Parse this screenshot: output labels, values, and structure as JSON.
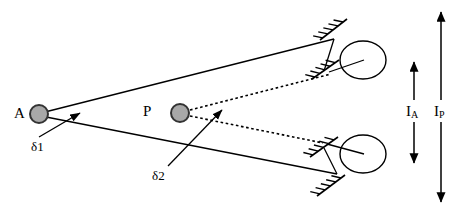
{
  "figure": {
    "background_color": "#ffffff",
    "line_color": "#000000",
    "node_fill_color": "#a8a8a8",
    "node_stroke_color": "#333333"
  },
  "nodes": [
    {
      "id": "A",
      "label": "A",
      "label_x": 14,
      "label_y": 106,
      "cx": 39,
      "cy": 114,
      "r": 9
    },
    {
      "id": "P",
      "label": "P",
      "label_x": 143,
      "label_y": 104,
      "cx": 180,
      "cy": 113,
      "r": 9
    }
  ],
  "deflection_labels": [
    {
      "id": "delta1",
      "label": "δ1",
      "label_x": 31,
      "label_y": 140,
      "arrow_from_x": 39,
      "arrow_from_y": 137,
      "arrow_to_x": 80,
      "arrow_to_y": 113
    },
    {
      "id": "delta2",
      "label": "δ2",
      "label_x": 152,
      "label_y": 169,
      "arrow_from_x": 168,
      "arrow_from_y": 166,
      "arrow_to_x": 222,
      "arrow_to_y": 110
    }
  ],
  "solid_beams": [
    {
      "id": "beam-upper",
      "x1": 41,
      "y1": 113,
      "x2": 334,
      "y2": 39
    },
    {
      "id": "beam-lower",
      "x1": 41,
      "y1": 116,
      "x2": 337,
      "y2": 174
    }
  ],
  "dotted_beams": [
    {
      "id": "dotted-upper",
      "x1": 190,
      "y1": 110,
      "x2": 331,
      "y2": 74
    },
    {
      "id": "dotted-lower",
      "x1": 190,
      "y1": 116,
      "x2": 323,
      "y2": 143
    }
  ],
  "supports": [
    {
      "id": "support-upper-outer",
      "x1": 320,
      "y1": 40,
      "x2": 347,
      "y2": 19,
      "ticks": 5
    },
    {
      "id": "support-upper-inner",
      "x1": 312,
      "y1": 79,
      "x2": 339,
      "y2": 60,
      "ticks": 5
    },
    {
      "id": "support-lower-inner",
      "x1": 310,
      "y1": 157,
      "x2": 338,
      "y2": 137,
      "ticks": 5
    },
    {
      "id": "support-lower-outer",
      "x1": 317,
      "y1": 196,
      "x2": 345,
      "y2": 175,
      "ticks": 5
    }
  ],
  "connectors": [
    {
      "id": "connector-upper",
      "x1": 334,
      "y1": 39,
      "x2": 324,
      "y2": 71
    },
    {
      "id": "connector-lower",
      "x1": 337,
      "y1": 174,
      "x2": 324,
      "y2": 148
    }
  ],
  "wheels": [
    {
      "id": "wheel-upper",
      "cx": 363,
      "cy": 60,
      "rx": 23,
      "ry": 19,
      "spoke_x1": 329,
      "spoke_y1": 72,
      "spoke_x2": 364,
      "spoke_y2": 60
    },
    {
      "id": "wheel-lower",
      "cx": 363,
      "cy": 154,
      "rx": 23,
      "ry": 19,
      "spoke_x1": 327,
      "spoke_y1": 144,
      "spoke_x2": 364,
      "spoke_y2": 154
    }
  ],
  "current_arrows": [
    {
      "id": "I-A",
      "label": "I",
      "subscript": "A",
      "label_x": 406,
      "label_y": 104,
      "x": 414,
      "y_top": 62,
      "y_bottom": 163
    },
    {
      "id": "I-P",
      "label": "I",
      "subscript": "P",
      "label_x": 434,
      "label_y": 104,
      "x": 441,
      "y_top": 12,
      "y_bottom": 202
    }
  ]
}
